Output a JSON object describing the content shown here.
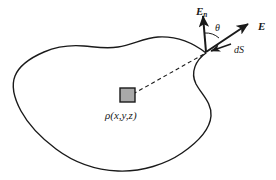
{
  "figure": {
    "background_color": "#ffffff",
    "stroke_color": "#1a1a1a",
    "width": 276,
    "height": 180
  },
  "surface": {
    "name": "closed-gaussian-surface",
    "fill": "#ffffff",
    "stroke": "#1a1a1a",
    "stroke_width": 1.4
  },
  "charge_element": {
    "label": "ρ(x,y,z)",
    "fill": "#a9a9a9",
    "stroke": "#1a1a1a",
    "x": 120,
    "y": 88,
    "size": 15
  },
  "ray": {
    "name": "radius-vector-dashed",
    "dash": "4,3",
    "from": [
      133,
      94
    ],
    "to": [
      206,
      53
    ]
  },
  "vectors": [
    {
      "id": "normal",
      "label_main": "E",
      "label_sub": "n",
      "label_x": 196,
      "label_y": 15,
      "from": [
        206,
        52
      ],
      "to": [
        202,
        12
      ],
      "bold": true
    },
    {
      "id": "field",
      "label_main": "E",
      "label_sub": "",
      "label_x": 258,
      "label_y": 30,
      "from": [
        206,
        52
      ],
      "to": [
        250,
        22
      ],
      "bold": true
    },
    {
      "id": "area-element",
      "label_main": "dS",
      "label_sub": "",
      "label_x": 234,
      "label_y": 53,
      "from": [
        231,
        44
      ],
      "to": [
        209,
        52
      ],
      "bold": false
    }
  ],
  "angle": {
    "symbol": "θ",
    "x": 215,
    "y": 31
  }
}
